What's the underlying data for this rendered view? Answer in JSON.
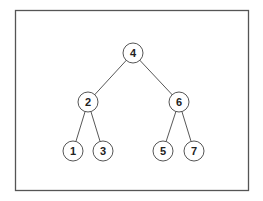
{
  "diagram": {
    "type": "binary-search-tree",
    "colors": {
      "frame": "#555555",
      "edge": "#444444",
      "node_stroke": "#555555",
      "node_fill": "#ffffff",
      "text": "#222222"
    },
    "nodes": [
      {
        "id": "n4",
        "label": "4",
        "x": 133,
        "y": 53
      },
      {
        "id": "n2",
        "label": "2",
        "x": 88,
        "y": 102
      },
      {
        "id": "n6",
        "label": "6",
        "x": 179,
        "y": 102
      },
      {
        "id": "n1",
        "label": "1",
        "x": 73,
        "y": 151
      },
      {
        "id": "n3",
        "label": "3",
        "x": 103,
        "y": 151
      },
      {
        "id": "n5",
        "label": "5",
        "x": 163,
        "y": 151
      },
      {
        "id": "n7",
        "label": "7",
        "x": 194,
        "y": 151
      }
    ],
    "edges": [
      {
        "from": "4",
        "to": "2"
      },
      {
        "from": "4",
        "to": "6"
      },
      {
        "from": "2",
        "to": "1"
      },
      {
        "from": "2",
        "to": "3"
      },
      {
        "from": "6",
        "to": "5"
      },
      {
        "from": "6",
        "to": "7"
      }
    ]
  }
}
